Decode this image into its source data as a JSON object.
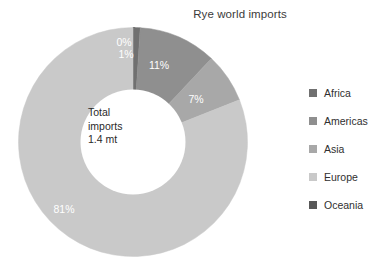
{
  "chart_data": {
    "type": "pie",
    "variant": "donut",
    "title": "Rye world imports",
    "xlabel": "",
    "ylabel": "",
    "grid": false,
    "legend_position": "right",
    "center_annotation": [
      "Total",
      "imports",
      "1.4 mt"
    ],
    "total_label": "Total imports",
    "total_value": "1.4 mt",
    "units": "mt",
    "start_angle_deg": 0,
    "direction": "clockwise",
    "categories": [
      "Oceania",
      "Africa",
      "Americas",
      "Asia",
      "Europe"
    ],
    "values": [
      0,
      1,
      11,
      7,
      81
    ],
    "value_labels": [
      "0%",
      "1%",
      "11%",
      "7%",
      "81%"
    ],
    "colors": [
      "#585858",
      "#707070",
      "#8f8f8f",
      "#a8a8a8",
      "#c9c9c9"
    ],
    "slices": [
      {
        "name": "Oceania",
        "percent": 0,
        "label": "0%",
        "color": "#585858"
      },
      {
        "name": "Africa",
        "percent": 1,
        "label": "1%",
        "color": "#707070"
      },
      {
        "name": "Americas",
        "percent": 11,
        "label": "11%",
        "color": "#8f8f8f"
      },
      {
        "name": "Asia",
        "percent": 7,
        "label": "7%",
        "color": "#a8a8a8"
      },
      {
        "name": "Europe",
        "percent": 81,
        "label": "81%",
        "color": "#c9c9c9"
      }
    ]
  },
  "legend": {
    "items": [
      {
        "label": "Africa",
        "color": "#707070"
      },
      {
        "label": "Americas",
        "color": "#8f8f8f"
      },
      {
        "label": "Asia",
        "color": "#a8a8a8"
      },
      {
        "label": "Europe",
        "color": "#c9c9c9"
      },
      {
        "label": "Oceania",
        "color": "#585858"
      }
    ]
  }
}
